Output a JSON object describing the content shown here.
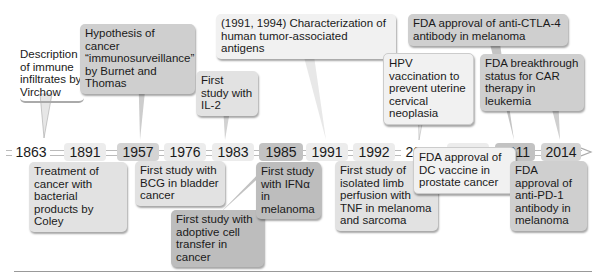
{
  "timeline": {
    "years": [
      "1863",
      "1891",
      "1957",
      "1976",
      "1983",
      "1985",
      "1991",
      "1992",
      "2009",
      "2010",
      "2011",
      "2014"
    ],
    "events_above": [
      {
        "year": "1863",
        "text": "Description of immune infiltrates by Virchow"
      },
      {
        "year": "1957",
        "text": "Hypothesis of cancer “immunosurveillance” by Burnet and Thomas"
      },
      {
        "year": "1983",
        "text": "First study with IL-2"
      },
      {
        "year": "1991",
        "text": "(1991, 1994) Characterization of human tumor-associated antigens"
      },
      {
        "year": "2009",
        "text": "HPV vaccination to prevent uterine cervical neoplasia"
      },
      {
        "year": "2011",
        "text": "FDA approval of anti-CTLA-4 antibody in melanoma"
      },
      {
        "year": "2014",
        "text": "FDA breakthrough status for CAR therapy in leukemia"
      }
    ],
    "events_below": [
      {
        "year": "1891",
        "text": "Treatment of cancer with bacterial products by Coley"
      },
      {
        "year": "1976",
        "text": "First study with BCG in bladder cancer"
      },
      {
        "year": "1985",
        "text": "First study with adoptive cell transfer in cancer"
      },
      {
        "year": "1985",
        "text": "First study with IFNα in melanoma"
      },
      {
        "year": "1992",
        "text": "First study of isolated limb perfusion with TNF in melanoma and sarcoma"
      },
      {
        "year": "2010",
        "text": "FDA approval of DC vaccine in prostate cancer"
      },
      {
        "year": "2014",
        "text": "FDA approval of anti-PD-1 antibody in melanoma"
      }
    ]
  },
  "colors": {
    "lightest": "#f1f1f1",
    "light": "#e2e2e2",
    "medium": "#cfcfcf",
    "dark": "#bdbdbd",
    "axis": "#bbbbbb"
  }
}
